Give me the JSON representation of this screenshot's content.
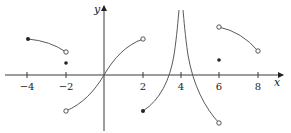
{
  "figure": {
    "x_axis_label": "x",
    "y_axis_label": "y",
    "x_ticks": [
      {
        "value": -4,
        "label": "−4"
      },
      {
        "value": -2,
        "label": "−2"
      },
      {
        "value": 2,
        "label": "2"
      },
      {
        "value": 4,
        "label": "4"
      },
      {
        "value": 6,
        "label": "6"
      },
      {
        "value": 8,
        "label": "8"
      }
    ],
    "pieces": [
      {
        "name": "piece-1",
        "from": {
          "x": -4,
          "closed": true
        },
        "to": {
          "x": -2,
          "closed": false
        },
        "description": "decreasing concave-down arc above axis"
      },
      {
        "name": "isolated-point-at-minus-2",
        "x": -2,
        "closed": true
      },
      {
        "name": "piece-2",
        "from": {
          "x": -2,
          "closed": false
        },
        "to": {
          "x": 2,
          "closed": false
        },
        "description": "increasing S-curve through origin"
      },
      {
        "name": "piece-3",
        "from": {
          "x": 2,
          "closed": true
        },
        "to": {
          "x": 4,
          "asymptote": true
        },
        "description": "increasing to vertical asymptote at x=4"
      },
      {
        "name": "piece-4",
        "from": {
          "x": 4,
          "asymptote": true
        },
        "to": {
          "x": 6,
          "closed": false
        },
        "description": "decreasing from vertical asymptote"
      },
      {
        "name": "isolated-point-at-6",
        "x": 6,
        "closed": true
      },
      {
        "name": "piece-5",
        "from": {
          "x": 6,
          "closed": false
        },
        "to": {
          "x": 8,
          "closed": false
        },
        "description": "decreasing concave-down arc above axis"
      }
    ],
    "vertical_asymptote_x": 4
  }
}
